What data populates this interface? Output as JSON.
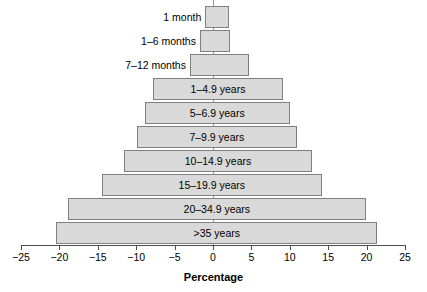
{
  "chart_data": {
    "type": "bar",
    "subtype": "population-pyramid-horizontal",
    "title": "",
    "xlabel": "Percentage",
    "ylabel": "",
    "xlim": [
      -25,
      25
    ],
    "xticks": [
      -25,
      -20,
      -15,
      -10,
      -5,
      0,
      5,
      10,
      15,
      20,
      25
    ],
    "xtick_labels": [
      "−25",
      "−20",
      "−15",
      "−10",
      "−5",
      "0",
      "5",
      "10",
      "15",
      "20",
      "25"
    ],
    "grid": false,
    "legend": null,
    "bar_fill_color": "#d9d9d9",
    "bar_border_color": "#808080",
    "axis_color": "#4d4d4d",
    "categories": [
      "1 month",
      "1–6 months",
      "7–12 months",
      "1–4.9 years",
      "5–6.9 years",
      "7–9.9 years",
      "10–14.9 years",
      "15–19.9 years",
      "20–34.9 years",
      ">35 years"
    ],
    "series": [
      {
        "name": "left",
        "values": [
          -1.0,
          -1.7,
          -3.0,
          -7.8,
          -8.9,
          -9.9,
          -11.6,
          -14.5,
          -18.9,
          -20.4
        ]
      },
      {
        "name": "right",
        "values": [
          2.1,
          2.2,
          4.7,
          9.1,
          10.0,
          10.9,
          12.9,
          14.2,
          19.9,
          21.4
        ]
      }
    ],
    "bars": [
      {
        "label": "1 month",
        "left": -1.0,
        "right": 2.1,
        "label_placement": "outside"
      },
      {
        "label": "1–6 months",
        "left": -1.7,
        "right": 2.2,
        "label_placement": "outside"
      },
      {
        "label": "7–12 months",
        "left": -3.0,
        "right": 4.7,
        "label_placement": "outside"
      },
      {
        "label": "1–4.9 years",
        "left": -7.8,
        "right": 9.1,
        "label_placement": "inside"
      },
      {
        "label": "5–6.9 years",
        "left": -8.9,
        "right": 10.0,
        "label_placement": "inside"
      },
      {
        "label": "7–9.9 years",
        "left": -9.9,
        "right": 10.9,
        "label_placement": "inside"
      },
      {
        "label": "10–14.9 years",
        "left": -11.6,
        "right": 12.9,
        "label_placement": "inside"
      },
      {
        "label": "15–19.9 years",
        "left": -14.5,
        "right": 14.2,
        "label_placement": "inside"
      },
      {
        "label": "20–34.9 years",
        "left": -18.9,
        "right": 19.9,
        "label_placement": "inside"
      },
      {
        "label": ">35 years",
        "left": -20.4,
        "right": 21.4,
        "label_placement": "inside"
      }
    ]
  }
}
